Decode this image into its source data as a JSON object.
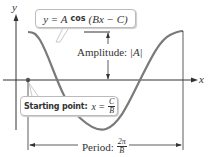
{
  "diagram": {
    "equation": {
      "prefix": "y = A",
      "func": "cos",
      "argument": "(Bx − C)"
    },
    "amplitude": {
      "label": "Amplitude: ",
      "value": "|A|"
    },
    "starting_point": {
      "label": "Starting point:",
      "expr": "x = ",
      "numerator": "C",
      "denominator": "B"
    },
    "period": {
      "label": "Period: ",
      "numerator": "2π",
      "denominator": "B"
    },
    "axes": {
      "x_label": "x",
      "y_label": "y"
    },
    "colors": {
      "curve": "#7a7a7a",
      "axes": "#333333",
      "text": "#333333",
      "box_border": "#bbbbbb"
    }
  }
}
